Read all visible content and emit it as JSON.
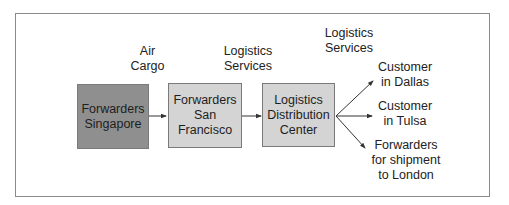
{
  "diagram": {
    "type": "flow",
    "colors": {
      "frame_border": "#8a8a8a",
      "node_dark": "#8f8f8f",
      "node_light": "#d4d4d4",
      "node_border": "#7a7a7a",
      "arrow": "#333333",
      "text": "#222222"
    },
    "nodes": [
      {
        "id": "singapore",
        "label": "Forwarders\nSingapore"
      },
      {
        "id": "sanfrancisco",
        "label": "Forwarders\nSan\nFrancisco"
      },
      {
        "id": "distribution",
        "label": "Logistics\nDistribution\nCenter"
      },
      {
        "id": "dallas",
        "label": "Customer\nin Dallas"
      },
      {
        "id": "tulsa",
        "label": "Customer\nin Tulsa"
      },
      {
        "id": "london",
        "label": "Forwarders\nfor shipment\nto London"
      }
    ],
    "edge_labels": [
      {
        "id": "air-cargo",
        "label": "Air\nCargo"
      },
      {
        "id": "logistics-services-1",
        "label": "Logistics\nServices"
      },
      {
        "id": "logistics-services-2",
        "label": "Logistics\nServices"
      }
    ],
    "edges": [
      {
        "from": "singapore",
        "to": "sanfrancisco",
        "label": "Air Cargo"
      },
      {
        "from": "sanfrancisco",
        "to": "distribution",
        "label": "Logistics Services"
      },
      {
        "from": "distribution",
        "to": "dallas",
        "label": "Logistics Services"
      },
      {
        "from": "distribution",
        "to": "tulsa",
        "label": ""
      },
      {
        "from": "distribution",
        "to": "london",
        "label": ""
      }
    ]
  }
}
